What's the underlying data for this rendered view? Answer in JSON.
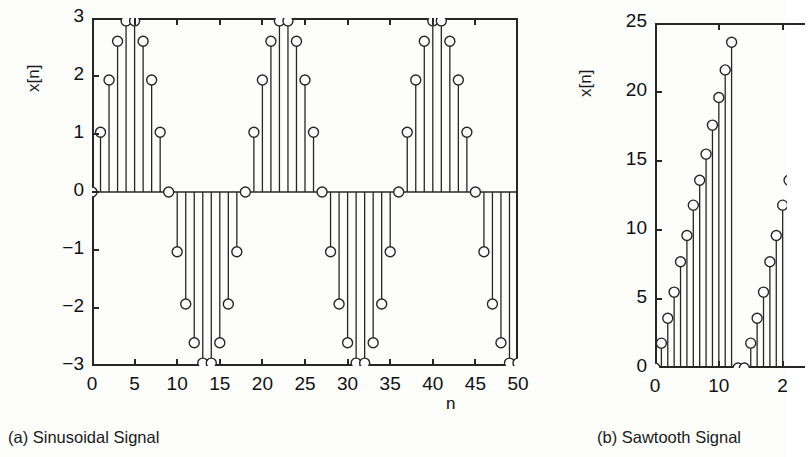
{
  "figure": {
    "panels": [
      {
        "id": "a",
        "caption": "(a) Sinusoidal Signal",
        "ylabel": "x[n]",
        "xlabel": "n",
        "chart_data": {
          "type": "stem",
          "title": "(a) Sinusoidal Signal",
          "xlabel": "n",
          "ylabel": "x[n]",
          "xlim": [
            0,
            50
          ],
          "ylim": [
            -3,
            3
          ],
          "xticks": [
            0,
            5,
            10,
            15,
            20,
            25,
            30,
            35,
            40,
            45,
            50
          ],
          "xtick_labels": [
            "0",
            "5",
            "10",
            "15",
            "20",
            "25",
            "30",
            "35",
            "40",
            "45",
            "50"
          ],
          "yticks": [
            -3,
            -2,
            -1,
            0,
            1,
            2,
            3
          ],
          "ytick_labels": [
            "−3",
            "−2",
            "−1",
            "0",
            "1",
            "2",
            "3"
          ],
          "grid": false,
          "legend": null,
          "expression": "x[n] = 3*sin(2*pi*n/18)",
          "amplitude": 3,
          "period": 18,
          "x": [
            0,
            1,
            2,
            3,
            4,
            5,
            6,
            7,
            8,
            9,
            10,
            11,
            12,
            13,
            14,
            15,
            16,
            17,
            18,
            19,
            20,
            21,
            22,
            23,
            24,
            25,
            26,
            27,
            28,
            29,
            30,
            31,
            32,
            33,
            34,
            35,
            36,
            37,
            38,
            39,
            40,
            41,
            42,
            43,
            44,
            45,
            46,
            47,
            48,
            49,
            50
          ],
          "values": [
            0,
            1.03,
            1.93,
            2.6,
            2.95,
            2.95,
            2.6,
            1.93,
            1.03,
            0,
            -1.03,
            -1.93,
            -2.6,
            -2.95,
            -2.95,
            -2.6,
            -1.93,
            -1.03,
            0,
            1.03,
            1.93,
            2.6,
            2.95,
            2.95,
            2.6,
            1.93,
            1.03,
            0,
            -1.03,
            -1.93,
            -2.6,
            -2.95,
            -2.95,
            -2.6,
            -1.93,
            -1.03,
            0,
            1.03,
            1.93,
            2.6,
            2.95,
            2.95,
            2.6,
            1.93,
            1.03,
            0,
            -1.03,
            -1.93,
            -2.6,
            -2.95,
            -2.95
          ]
        }
      },
      {
        "id": "b",
        "caption": "(b) Sawtooth Signal",
        "ylabel": "x[n]",
        "xlabel": "",
        "chart_data": {
          "type": "stem",
          "title": "(b) Sawtooth Signal",
          "xlabel": "",
          "ylabel": "x[n]",
          "xlim": [
            0,
            23.5
          ],
          "ylim": [
            0,
            25
          ],
          "xticks": [
            0,
            10,
            20
          ],
          "xtick_labels": [
            "0",
            "10",
            "2"
          ],
          "yticks": [
            0,
            5,
            10,
            15,
            20,
            25
          ],
          "ytick_labels": [
            "0",
            "5",
            "10",
            "15",
            "20",
            "25"
          ],
          "grid": false,
          "legend": null,
          "expression": "sawtooth, period 14, ramp 0 to 23.6",
          "period": 14,
          "peak": 23.6,
          "clipped_right": true,
          "x": [
            0,
            1,
            2,
            3,
            4,
            5,
            6,
            7,
            8,
            9,
            10,
            11,
            12,
            13,
            14,
            15,
            16,
            17,
            18,
            19,
            20,
            21,
            22,
            23
          ],
          "values": [
            0,
            1.8,
            3.6,
            5.5,
            7.7,
            9.6,
            11.8,
            13.6,
            15.5,
            17.6,
            19.6,
            21.6,
            23.6,
            0,
            0,
            1.8,
            3.6,
            5.5,
            7.7,
            9.6,
            11.8,
            13.6,
            15.5,
            17.6
          ]
        }
      }
    ]
  },
  "colors": {
    "stroke": "#262626",
    "marker_fill": "#ffffff",
    "text": "#111111",
    "background": "#fdfdfc"
  }
}
